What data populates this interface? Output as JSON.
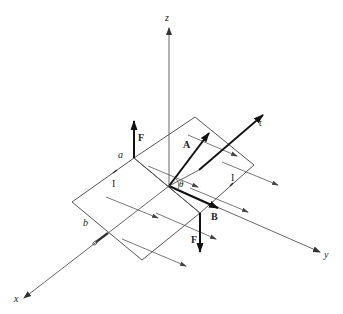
{
  "figure": {
    "axes": {
      "x": "x",
      "y": "y",
      "z": "z"
    },
    "vectors": {
      "force_top": "F",
      "force_bottom": "F",
      "area": "A",
      "field": "B",
      "torque": "τ"
    },
    "current_labels": [
      "I",
      "I"
    ],
    "side_labels": {
      "a": "a",
      "b": "b"
    },
    "angle": "θ",
    "colors": {
      "line": "#555555",
      "vector": "#111111",
      "background": "#ffffff"
    }
  }
}
